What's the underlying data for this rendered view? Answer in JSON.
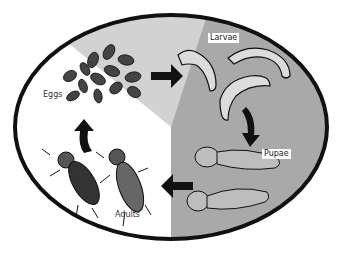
{
  "colors": {
    "background": "#ffffff",
    "outline": "#111111",
    "eggs_region": "#d2d2d2",
    "larvae_pupae_region": "#a9a9a9",
    "adults_region": "#ffffff",
    "arrow": "#111111"
  },
  "stages": [
    {
      "id": "eggs",
      "label": "Eggs"
    },
    {
      "id": "larvae",
      "label": "Larvae"
    },
    {
      "id": "pupae",
      "label": "Pupae"
    },
    {
      "id": "adults",
      "label": "Adults"
    }
  ],
  "arrows": [
    {
      "from": "eggs",
      "to": "larvae",
      "direction": "right"
    },
    {
      "from": "larvae",
      "to": "pupae",
      "direction": "down"
    },
    {
      "from": "pupae",
      "to": "adults",
      "direction": "left"
    },
    {
      "from": "adults",
      "to": "eggs",
      "direction": "up"
    }
  ]
}
